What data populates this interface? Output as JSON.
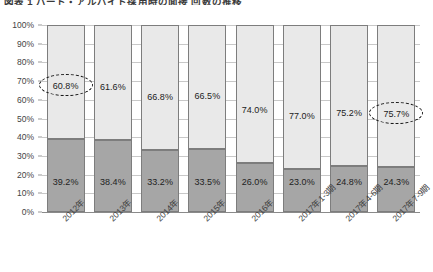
{
  "chart_title": "図表 1 パート・アルバイト採用時の面接 回数の推移",
  "chart_data": {
    "type": "bar",
    "subtype": "stacked-100-percent",
    "title": "図表 1 パート・アルバイト採用時の面接 回数の推移",
    "xlabel": "",
    "ylabel": "",
    "ylim": [
      0,
      100
    ],
    "ytick_labels": [
      "0%",
      "10%",
      "20%",
      "30%",
      "40%",
      "50%",
      "60%",
      "70%",
      "80%",
      "90%",
      "100%"
    ],
    "ytick_values": [
      0,
      10,
      20,
      30,
      40,
      50,
      60,
      70,
      80,
      90,
      100
    ],
    "grid": true,
    "legend": "none",
    "categories": [
      "2012年",
      "2013年",
      "2014年",
      "2015年",
      "2016年",
      "2017年1-3期",
      "2017年4-6期",
      "2017年7-9期"
    ],
    "series": [
      {
        "name": "下段（濃いグレー）",
        "color": "#a6a6a6",
        "values": [
          39.2,
          38.4,
          33.2,
          33.5,
          26.0,
          23.0,
          24.8,
          24.3
        ],
        "labels": [
          "39.2%",
          "38.4%",
          "33.2%",
          "33.5%",
          "26.0%",
          "23.0%",
          "24.8%",
          "24.3%"
        ]
      },
      {
        "name": "上段（薄いグレー）",
        "color": "#e9e9e9",
        "values": [
          60.8,
          61.6,
          66.8,
          66.5,
          74.0,
          77.0,
          75.2,
          75.7
        ],
        "labels": [
          "60.8%",
          "61.6%",
          "66.8%",
          "66.5%",
          "74.0%",
          "77.0%",
          "75.2%",
          "75.7%"
        ]
      }
    ],
    "annotations": [
      {
        "type": "dashed-ellipse",
        "target_category": "2012年",
        "target_label": "60.8%"
      },
      {
        "type": "dashed-ellipse",
        "target_category": "2017年7-9期",
        "target_label": "75.7%"
      }
    ],
    "colors": {
      "top_segment": "#e9e9e9",
      "bottom_segment": "#a6a6a6",
      "bar_border": "#7d7d7d",
      "gridline": "#c8c8c8",
      "axis": "#8a8a8a",
      "text": "#2b2b2b",
      "highlight": "#1a1a1a"
    }
  }
}
